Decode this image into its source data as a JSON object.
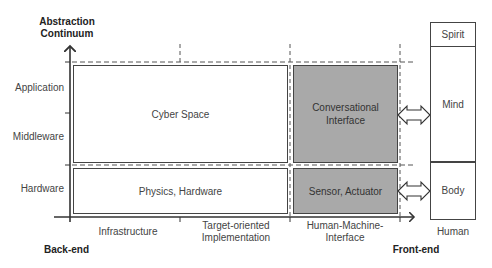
{
  "y_axis": {
    "title_line1": "Abstraction",
    "title_line2": "Continuum",
    "levels": [
      "Application",
      "Middleware",
      "Hardware"
    ]
  },
  "x_axis": {
    "columns": [
      "Infrastructure",
      "Target-oriented Implementation",
      "Human-Machine-Interface"
    ],
    "col2_line1": "Target-oriented",
    "col2_line2": "Implementation",
    "col3_line1": "Human-Machine-",
    "col3_line2": "Interface",
    "left_end": "Back-end",
    "right_end": "Front-end"
  },
  "boxes": {
    "cyber_space": "Cyber Space",
    "physics_hardware": "Physics, Hardware",
    "conv_line1": "Conversational",
    "conv_line2": "Interface",
    "sensor_actuator": "Sensor, Actuator"
  },
  "human": {
    "label": "Human",
    "layers": [
      "Spirit",
      "Mind",
      "Body"
    ]
  },
  "colors": {
    "grey_fill": "#a9a9a9",
    "line": "#444444"
  }
}
